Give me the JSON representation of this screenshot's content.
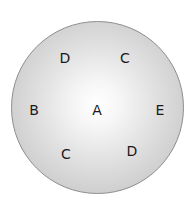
{
  "diagram": {
    "shape": "circle",
    "fill": "radial gradient white center to gray edge",
    "colors": {
      "center": "#ffffff",
      "edge": "#bdbdbd",
      "border": "#8e8e8e",
      "text": "#1a1a1a"
    },
    "labels": [
      {
        "id": "top-left",
        "text": "D",
        "x": 65,
        "y": 58
      },
      {
        "id": "top-right",
        "text": "C",
        "x": 125,
        "y": 58
      },
      {
        "id": "left",
        "text": "B",
        "x": 34,
        "y": 110
      },
      {
        "id": "center",
        "text": "A",
        "x": 97,
        "y": 110
      },
      {
        "id": "right",
        "text": "E",
        "x": 160,
        "y": 110
      },
      {
        "id": "bottom-left",
        "text": "C",
        "x": 66,
        "y": 154
      },
      {
        "id": "bottom-right",
        "text": "D",
        "x": 132,
        "y": 151
      }
    ]
  }
}
